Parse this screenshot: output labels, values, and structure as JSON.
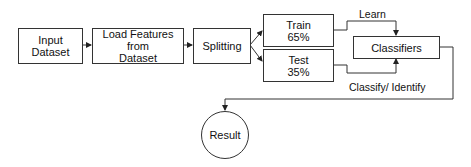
{
  "diagram": {
    "nodes": {
      "input": {
        "label": "Input Dataset"
      },
      "load": {
        "label_line1": "Load Features from",
        "label_line2": "Dataset"
      },
      "split": {
        "label": "Splitting"
      },
      "train": {
        "label_line1": "Train",
        "label_line2": "65%"
      },
      "test": {
        "label_line1": "Test",
        "label_line2": "35%"
      },
      "classifiers": {
        "label": "Classifiers"
      },
      "result": {
        "label": "Result"
      }
    },
    "edge_labels": {
      "learn": "Learn",
      "classify": "Classify/ Identify"
    },
    "edges": [
      {
        "from": "Input Dataset",
        "to": "Load Features from Dataset"
      },
      {
        "from": "Load Features from Dataset",
        "to": "Splitting"
      },
      {
        "from": "Splitting",
        "to": "Train 65%"
      },
      {
        "from": "Splitting",
        "to": "Test 35%"
      },
      {
        "from": "Train 65%",
        "to": "Classifiers",
        "label": "Learn"
      },
      {
        "from": "Test 35%",
        "to": "Classifiers"
      },
      {
        "from": "Classifiers",
        "to": "Result",
        "label": "Classify/ Identify"
      }
    ],
    "colors": {
      "stroke": "#333333",
      "background": "#ffffff"
    }
  }
}
